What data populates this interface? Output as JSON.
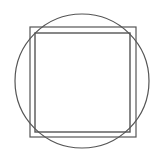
{
  "diagram": {
    "colors": {
      "stroke": "#555555",
      "background": "#ffffff"
    },
    "circle": {
      "cx": 82,
      "cy": 81,
      "r": 67
    },
    "outer_square": {
      "x": 30,
      "y": 27,
      "w": 106,
      "h": 110
    },
    "inner_square": {
      "x": 35,
      "y": 33,
      "w": 95,
      "h": 99
    }
  }
}
